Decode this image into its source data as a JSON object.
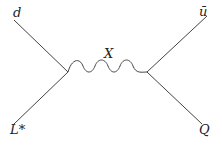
{
  "diagram": {
    "type": "feynman",
    "labels": {
      "top_left": "d",
      "top_right": "ū",
      "bottom_left": "L*",
      "bottom_right": "Q",
      "propagator": "X"
    },
    "colors": {
      "line": "#444444",
      "text": "#222222"
    }
  }
}
